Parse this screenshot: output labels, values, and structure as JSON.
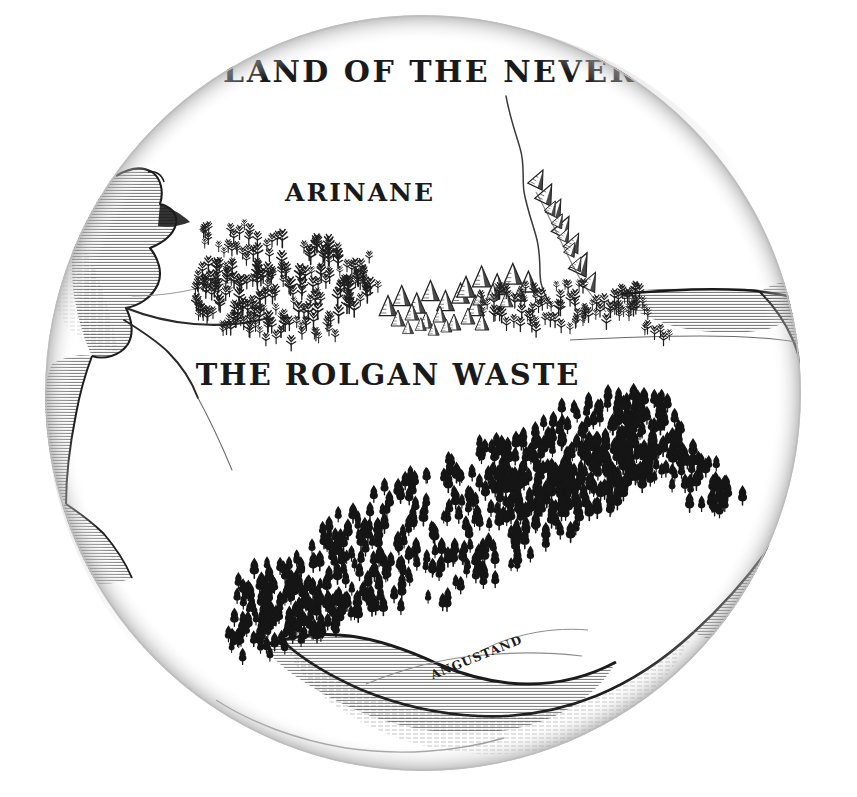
{
  "map": {
    "title_visible": "E LAND OF THE NEVERS",
    "title_note": "clipped at both circle edges",
    "frame": {
      "shape": "circle",
      "center_x": 423,
      "center_y": 393,
      "radius": 378,
      "fill_color": "#ffffff",
      "edge_color": "#b9b9b9",
      "shadow_color": "#c9c9c9"
    },
    "background_color": "#ffffff",
    "ink_color": "#1a1a1a",
    "labels": [
      {
        "id": "title",
        "text": "E LAND OF THE NEVERS",
        "x": 423,
        "y": 82,
        "size": 30,
        "rotate": 0,
        "tracking": 2.5,
        "style": "uncial"
      },
      {
        "id": "arinane",
        "text": "ARINANE",
        "x": 360,
        "y": 201,
        "size": 25,
        "rotate": 0,
        "tracking": 2.0,
        "style": "uncial"
      },
      {
        "id": "rolgan",
        "text": "THE ROLGAN WASTE",
        "x": 388,
        "y": 385,
        "size": 29,
        "rotate": 0,
        "tracking": 2.0,
        "style": "uncial"
      },
      {
        "id": "angustand",
        "text": "ANGUSTAND",
        "x": 478,
        "y": 661,
        "size": 12,
        "rotate": -22,
        "tracking": 1.0,
        "style": "uncial"
      }
    ],
    "regions": [
      {
        "name": "arinane",
        "type": "land-region"
      },
      {
        "name": "the-rolgan-waste",
        "type": "land-region"
      },
      {
        "name": "angustand",
        "type": "land-region"
      }
    ],
    "features": {
      "coastlines": 4,
      "rivers": 3,
      "mountain_ranges": 3,
      "forests": [
        {
          "name": "northern-scrub-forest",
          "style": "sparse-deciduous",
          "count": 190
        },
        {
          "name": "southern-great-forest",
          "style": "dense-conifer",
          "count": 520
        }
      ]
    }
  }
}
